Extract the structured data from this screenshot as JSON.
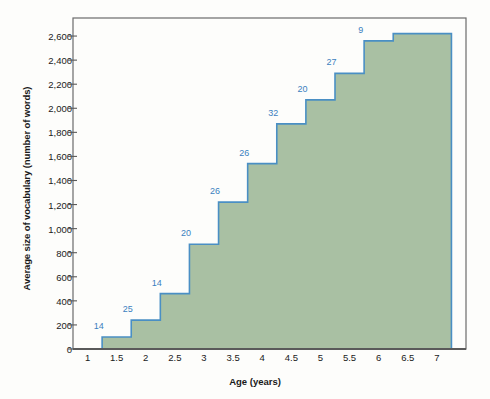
{
  "chart_data": {
    "type": "area",
    "title": "",
    "xlabel": "Age (years)",
    "ylabel": "Average size of vocabulary (number of words)",
    "xlim": [
      0.75,
      7.5
    ],
    "ylim": [
      0,
      2750
    ],
    "grid": false,
    "legend": null,
    "x_ticks": [
      "1",
      "1.5",
      "2",
      "2.5",
      "3",
      "3.5",
      "4",
      "4.5",
      "5",
      "5.5",
      "6",
      "6.5",
      "7"
    ],
    "x_tick_values": [
      1,
      1.5,
      2,
      2.5,
      3,
      3.5,
      4,
      4.5,
      5,
      5.5,
      6,
      6.5,
      7
    ],
    "y_ticks": [
      "0",
      "200",
      "400",
      "600",
      "800",
      "1,000",
      "1,200",
      "1,400",
      "1,600",
      "1,800",
      "2,000",
      "2,200",
      "2,400",
      "2,600"
    ],
    "y_tick_values": [
      0,
      200,
      400,
      600,
      800,
      1000,
      1200,
      1400,
      1600,
      1800,
      2000,
      2200,
      2400,
      2600
    ],
    "series": [
      {
        "name": "Average vocabulary size",
        "style": "step",
        "fill_color": "#a9c0a3",
        "line_color": "#4a8fc4",
        "steps": [
          {
            "x_start": 1.25,
            "x_end": 1.75,
            "value": 100,
            "label": "14"
          },
          {
            "x_start": 1.75,
            "x_end": 2.25,
            "value": 240,
            "label": "25"
          },
          {
            "x_start": 2.25,
            "x_end": 2.75,
            "value": 460,
            "label": "14"
          },
          {
            "x_start": 2.75,
            "x_end": 3.25,
            "value": 870,
            "label": "20"
          },
          {
            "x_start": 3.25,
            "x_end": 3.75,
            "value": 1220,
            "label": "26"
          },
          {
            "x_start": 3.75,
            "x_end": 4.25,
            "value": 1540,
            "label": "26"
          },
          {
            "x_start": 4.25,
            "x_end": 4.75,
            "value": 1870,
            "label": "32"
          },
          {
            "x_start": 4.75,
            "x_end": 5.25,
            "value": 2070,
            "label": "20"
          },
          {
            "x_start": 5.25,
            "x_end": 5.75,
            "value": 2290,
            "label": "27"
          },
          {
            "x_start": 5.75,
            "x_end": 6.25,
            "value": 2560,
            "label": "9"
          },
          {
            "x_start": 6.25,
            "x_end": 7.25,
            "value": 2620,
            "label": ""
          }
        ]
      }
    ],
    "annotations": [
      {
        "text": "14",
        "x": 1.5,
        "y": 100,
        "kind": "sample-size"
      },
      {
        "text": "25",
        "x": 2.0,
        "y": 240,
        "kind": "sample-size"
      },
      {
        "text": "14",
        "x": 2.5,
        "y": 460,
        "kind": "sample-size"
      },
      {
        "text": "20",
        "x": 3.0,
        "y": 870,
        "kind": "sample-size"
      },
      {
        "text": "26",
        "x": 3.5,
        "y": 1220,
        "kind": "sample-size"
      },
      {
        "text": "26",
        "x": 4.0,
        "y": 1540,
        "kind": "sample-size"
      },
      {
        "text": "32",
        "x": 4.5,
        "y": 1870,
        "kind": "sample-size"
      },
      {
        "text": "20",
        "x": 5.0,
        "y": 2070,
        "kind": "sample-size"
      },
      {
        "text": "27",
        "x": 5.5,
        "y": 2290,
        "kind": "sample-size"
      },
      {
        "text": "9",
        "x": 6.0,
        "y": 2560,
        "kind": "sample-size"
      }
    ]
  },
  "colors": {
    "fill": "#a9c0a3",
    "line": "#4a8fc4",
    "label_text": "#3b7fbf",
    "axis": "#5a5a5a",
    "frame": "#6b6b6b",
    "background": "#fdfdfb",
    "text": "#1a1a1a"
  }
}
